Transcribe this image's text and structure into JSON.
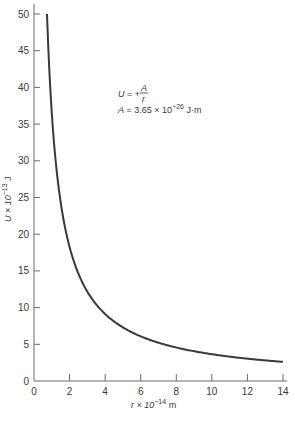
{
  "chart_data": {
    "type": "line",
    "title": "",
    "xlabel": "r × 10^-14 m",
    "ylabel": "U × 10^-13 J",
    "xlim": [
      0,
      14
    ],
    "ylim": [
      0,
      50
    ],
    "xticks": [
      0,
      2,
      4,
      6,
      8,
      10,
      12,
      14
    ],
    "yticks": [
      0,
      5,
      10,
      15,
      20,
      25,
      30,
      35,
      40,
      45,
      50
    ],
    "grid": false,
    "legend": null,
    "series": [
      {
        "name": "U = +A/r",
        "formula": "U = 36.5 / r",
        "x": [
          0.73,
          1,
          1.5,
          2,
          3,
          4,
          5,
          6,
          7,
          8,
          9,
          10,
          11,
          12,
          13,
          14
        ],
        "values": [
          50,
          36.5,
          24.3,
          18.3,
          12.2,
          9.1,
          7.3,
          6.1,
          5.2,
          4.6,
          4.1,
          3.65,
          3.3,
          3.0,
          2.8,
          2.6
        ]
      }
    ],
    "annotations": [
      {
        "text": "U = +A/r",
        "x": 5.1,
        "y": 42
      },
      {
        "text": "A = 3.65 × 10^-26 J·m",
        "x": 5.1,
        "y": 39.5
      }
    ]
  },
  "labels": {
    "x_axis": {
      "main": "r × 10",
      "exp": "−14",
      "unit": " m"
    },
    "y_axis": {
      "main": "U × 10",
      "exp": "−13",
      "unit": " J"
    },
    "formula": {
      "lhs": "U",
      "eq": " = +",
      "num": "A",
      "den": "r"
    },
    "constant": {
      "lhs": "A",
      "eq": " = 3.65 × 10",
      "exp": "−26",
      "unit": " J·m"
    }
  },
  "colors": {
    "curve": "#3a3a3a",
    "axis": "#6a6a6a",
    "text": "#3a3a3a"
  }
}
